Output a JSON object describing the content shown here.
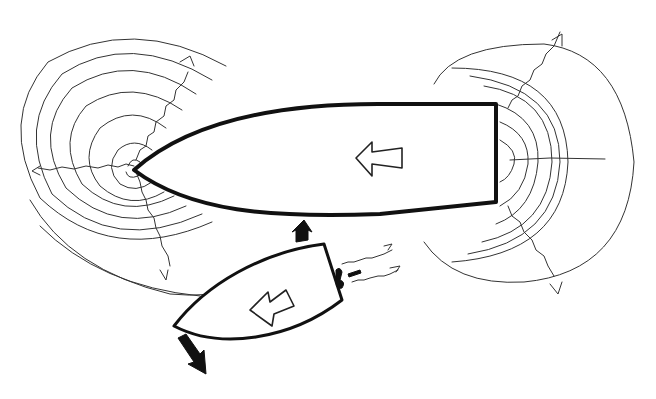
{
  "diagram": {
    "type": "hand-drawn sketch",
    "colors": {
      "background": "#ffffff",
      "ink": "#111111",
      "wave_ink": "#333333"
    },
    "large_vessel": {
      "label": "large-vessel",
      "direction": "left",
      "bow_wave_rings": 7,
      "stern_wave_rings": 7
    },
    "small_vessel": {
      "label": "small-vessel",
      "direction": "left",
      "propeller_wash_arrows": 2,
      "push_arrows": 2
    }
  }
}
